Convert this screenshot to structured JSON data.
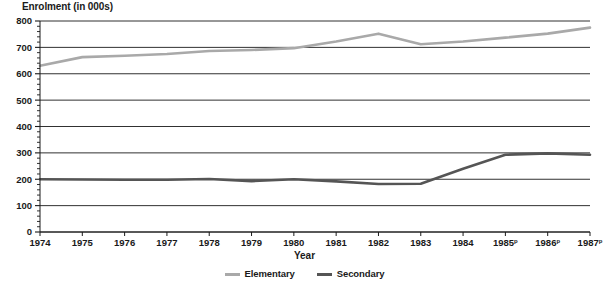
{
  "chart_data": {
    "type": "line",
    "title": "Enrolment (in 000s)",
    "xlabel": "Year",
    "ylabel": "",
    "ylim": [
      0,
      800
    ],
    "ytick_step": 100,
    "yticks": [
      "0",
      "100",
      "200",
      "300",
      "400",
      "500",
      "600",
      "700",
      "800"
    ],
    "minor_ticks_per_interval": 5,
    "grid": true,
    "legend_position": "bottom-center",
    "categories": [
      "1974",
      "1975",
      "1976",
      "1977",
      "1978",
      "1979",
      "1980",
      "1981",
      "1982",
      "1983",
      "1984",
      "1985",
      "1986",
      "1987"
    ],
    "xtick_labels": [
      {
        "label": "1974",
        "sup": ""
      },
      {
        "label": "1975",
        "sup": ""
      },
      {
        "label": "1976",
        "sup": ""
      },
      {
        "label": "1977",
        "sup": ""
      },
      {
        "label": "1978",
        "sup": ""
      },
      {
        "label": "1979",
        "sup": ""
      },
      {
        "label": "1980",
        "sup": ""
      },
      {
        "label": "1981",
        "sup": ""
      },
      {
        "label": "1982",
        "sup": ""
      },
      {
        "label": "1983",
        "sup": ""
      },
      {
        "label": "1984",
        "sup": ""
      },
      {
        "label": "1985",
        "sup": "p"
      },
      {
        "label": "1986",
        "sup": "p"
      },
      {
        "label": "1987",
        "sup": "p"
      }
    ],
    "series": [
      {
        "name": "Elementary",
        "color": "#a9a9a9",
        "values": [
          630,
          663,
          668,
          675,
          686,
          690,
          697,
          722,
          752,
          712,
          722,
          737,
          752,
          775
        ]
      },
      {
        "name": "Secondary",
        "color": "#555555",
        "values": [
          200,
          199,
          198,
          198,
          201,
          193,
          200,
          192,
          182,
          183,
          240,
          293,
          298,
          293
        ]
      }
    ]
  },
  "legend": {
    "items": [
      {
        "label": "Elementary",
        "color": "#a9a9a9"
      },
      {
        "label": "Secondary",
        "color": "#555555"
      }
    ]
  },
  "footnote": {
    "text": ""
  }
}
